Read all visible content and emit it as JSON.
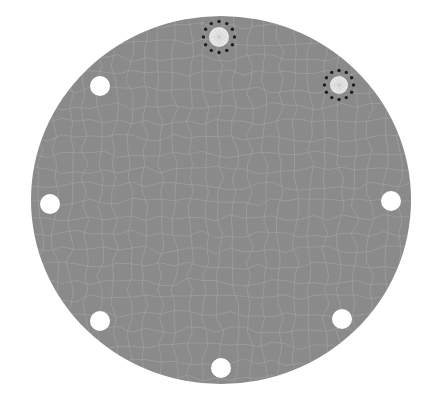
{
  "diagram": {
    "colors": {
      "background": "#ffffff",
      "plate": "#8a8a8a",
      "crack_lines": "#a9a9a9",
      "hole": "#ffffff",
      "marked_hole_fill": "#e6e6e6",
      "marker_dots": "#1e1e1e"
    },
    "plate": {
      "cx": 221,
      "cy": 200,
      "rx": 190,
      "ry": 184
    },
    "holes": [
      {
        "id": "top",
        "cx": 219,
        "cy": 37,
        "r": 10,
        "marked": true
      },
      {
        "id": "upper-right",
        "cx": 339,
        "cy": 85,
        "r": 9,
        "marked": true
      },
      {
        "id": "upper-left",
        "cx": 100,
        "cy": 86,
        "r": 10,
        "marked": false
      },
      {
        "id": "left",
        "cx": 50,
        "cy": 204,
        "r": 10,
        "marked": false
      },
      {
        "id": "right",
        "cx": 391,
        "cy": 201,
        "r": 10,
        "marked": false
      },
      {
        "id": "lower-left",
        "cx": 100,
        "cy": 321,
        "r": 10,
        "marked": false
      },
      {
        "id": "lower-right",
        "cx": 342,
        "cy": 319,
        "r": 10,
        "marked": false
      },
      {
        "id": "bottom",
        "cx": 221,
        "cy": 368,
        "r": 10,
        "marked": false
      }
    ]
  }
}
